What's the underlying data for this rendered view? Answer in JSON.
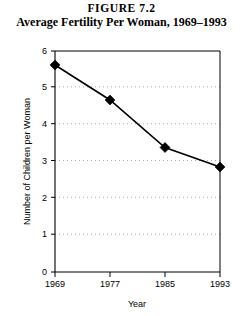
{
  "figure": {
    "number_label": "FIGURE 7.2",
    "title": "Average Fertility Per Woman, 1969–1993"
  },
  "chart_data": {
    "type": "line",
    "title": "Average Fertility Per Woman, 1969–1993",
    "xlabel": "Year",
    "ylabel": "Number of Children per Woman",
    "categories": [
      "1969",
      "1977",
      "1985",
      "1993"
    ],
    "x": [
      1969,
      1977,
      1985,
      1993
    ],
    "values": [
      5.62,
      4.67,
      3.38,
      2.85
    ],
    "series": [
      {
        "name": "Average fertility per woman",
        "values": [
          5.62,
          4.67,
          3.38,
          2.85
        ]
      }
    ],
    "xlim": [
      1969,
      1993
    ],
    "ylim": [
      0,
      6
    ],
    "ytick_labels": [
      "0",
      "1",
      "2",
      "3",
      "4",
      "5",
      "6"
    ],
    "ytick_values": [
      0,
      1,
      2,
      3,
      4,
      5,
      6
    ],
    "xtick_labels": [
      "1969",
      "1977",
      "1985",
      "1993"
    ],
    "grid": "horizontal-dotted",
    "legend": "none",
    "marker": "diamond",
    "line_color": "#000000",
    "marker_color": "#000000",
    "grid_color": "#9a9a9a",
    "background_color": "#ffffff"
  },
  "axis": {
    "y_title": "Number of Children per Woman",
    "x_title": "Year"
  }
}
